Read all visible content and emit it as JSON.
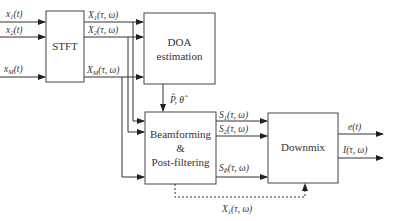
{
  "diagram": {
    "type": "block-diagram",
    "blocks": {
      "stft": {
        "label": "STFT"
      },
      "doa": {
        "line1": "DOA",
        "line2": "estimation"
      },
      "beamforming": {
        "line1": "Beamforming",
        "line2": "&",
        "line3": "Post-filtering"
      },
      "downmix": {
        "label": "Downmix"
      }
    },
    "inputs": [
      {
        "base": "x",
        "sub": "1",
        "arg": "(t)"
      },
      {
        "base": "x",
        "sub": "2",
        "arg": "(t)"
      },
      {
        "base": "x",
        "sub": "M",
        "arg": "(t)"
      }
    ],
    "stft_outputs": [
      {
        "base": "X",
        "sub": "1",
        "arg": "(τ, ω)"
      },
      {
        "base": "X",
        "sub": "2",
        "arg": "(τ, ω)"
      },
      {
        "base": "X",
        "sub": "M",
        "arg": "(τ, ω)"
      }
    ],
    "doa_output": {
      "label": "P̂, θ̂"
    },
    "bf_outputs": [
      {
        "base": "S",
        "sub": "1",
        "arg": "(τ, ω)"
      },
      {
        "base": "S",
        "sub": "2",
        "arg": "(τ, ω)"
      },
      {
        "base": "S",
        "sub": "P̂",
        "arg": "(τ, ω)"
      }
    ],
    "downmix_outputs": [
      {
        "label": "e(t)"
      },
      {
        "label": "I(τ, ω)"
      }
    ],
    "feedthrough": {
      "base": "X",
      "sub": "1",
      "arg": "(τ, ω)"
    },
    "colors": {
      "line": "#333333",
      "background": "#ffffff"
    }
  }
}
